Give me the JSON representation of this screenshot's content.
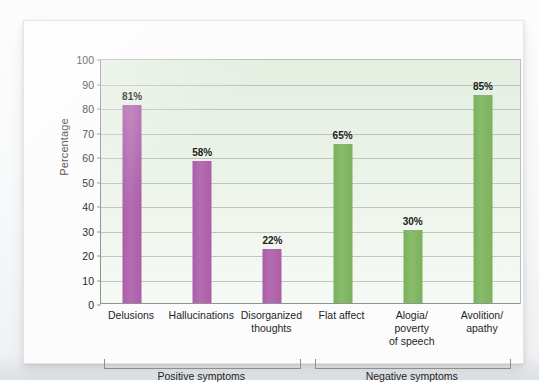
{
  "chart_data": {
    "type": "bar",
    "title": "",
    "xlabel": "",
    "ylabel": "Percentage",
    "ylim": [
      0,
      100
    ],
    "ytick_step": 10,
    "yticks": [
      100,
      90,
      80,
      70,
      60,
      50,
      40,
      30,
      20,
      10,
      0
    ],
    "grid": true,
    "legend": "none",
    "categories": [
      "Delusions",
      "Hallucinations",
      "Disorganized thoughts",
      "Flat affect",
      "Alogia/ poverty of speech",
      "Avolition/ apathy"
    ],
    "values": [
      81,
      58,
      22,
      65,
      30,
      85
    ],
    "value_labels": [
      "81%",
      "58%",
      "22%",
      "65%",
      "30%",
      "85%"
    ],
    "bars": [
      {
        "label_lines": [
          "Delusions"
        ],
        "value": 81,
        "value_label": "81%",
        "color": "#b066b0",
        "group": "Positive symptoms"
      },
      {
        "label_lines": [
          "Hallucinations"
        ],
        "value": 58,
        "value_label": "58%",
        "color": "#b066b0",
        "group": "Positive symptoms"
      },
      {
        "label_lines": [
          "Disorganized",
          "thoughts"
        ],
        "value": 22,
        "value_label": "22%",
        "color": "#b066b0",
        "group": "Positive symptoms"
      },
      {
        "label_lines": [
          "Flat affect"
        ],
        "value": 65,
        "value_label": "65%",
        "color": "#7cb45c",
        "group": "Negative symptoms"
      },
      {
        "label_lines": [
          "Alogia/",
          "poverty",
          "of speech"
        ],
        "value": 30,
        "value_label": "30%",
        "color": "#7cb45c",
        "group": "Negative symptoms"
      },
      {
        "label_lines": [
          "Avolition/",
          "apathy"
        ],
        "value": 85,
        "value_label": "85%",
        "color": "#7cb45c",
        "group": "Negative symptoms"
      }
    ],
    "groups": [
      {
        "label": "Positive symptoms",
        "color": "#b066b0"
      },
      {
        "label": "Negative symptoms",
        "color": "#7cb45c"
      }
    ],
    "colors": {
      "positive_bar": "#b066b0",
      "negative_bar": "#7cb45c",
      "plot_background": "#e9f1e6",
      "gridline": "#b6bdb9",
      "axis": "#8e9493",
      "text": "#1f1f1f",
      "card_background": "#fcfcfc"
    }
  }
}
